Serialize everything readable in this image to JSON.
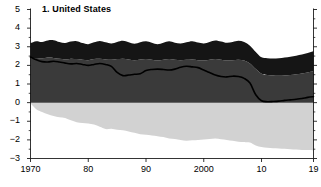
{
  "panel": {
    "title": "1. United States"
  },
  "chart_data": {
    "type": "area",
    "title": "1. United States",
    "subtitle": "",
    "xlabel": "",
    "ylabel": "",
    "xlim": [
      1970,
      2019
    ],
    "ylim": [
      -3,
      5
    ],
    "grid": false,
    "legend_position": "none",
    "stacked": true,
    "zero_line": 0,
    "y_ticks": [
      -3,
      -2,
      -1,
      0,
      1,
      2,
      3,
      4,
      5
    ],
    "y_tick_labels": [
      "−3",
      "−2",
      "−1",
      "0",
      "1",
      "2",
      "3",
      "4",
      "5"
    ],
    "y_minor_ticks": [
      -2.5,
      -1.5,
      -0.5,
      0.5,
      1.5,
      2.5,
      3.5,
      4.5
    ],
    "x_ticks": [
      1970,
      1980,
      1990,
      2000,
      2010,
      2019
    ],
    "x_tick_labels": [
      "1970",
      "80",
      "90",
      "2000",
      "10",
      "19"
    ],
    "x": [
      1970,
      1971,
      1972,
      1973,
      1974,
      1975,
      1976,
      1977,
      1978,
      1979,
      1980,
      1981,
      1982,
      1983,
      1984,
      1985,
      1986,
      1987,
      1988,
      1989,
      1990,
      1991,
      1992,
      1993,
      1994,
      1995,
      1996,
      1997,
      1998,
      1999,
      2000,
      2001,
      2002,
      2003,
      2004,
      2005,
      2006,
      2007,
      2008,
      2009,
      2010,
      2011,
      2012,
      2013,
      2014,
      2015,
      2016,
      2017,
      2018,
      2019
    ],
    "series": [
      {
        "name": "upper-band",
        "color": "#151515",
        "stack_from": "positive-band",
        "values": [
          0.85,
          0.9,
          0.88,
          0.92,
          0.95,
          0.9,
          0.88,
          0.92,
          0.96,
          0.9,
          0.86,
          0.9,
          0.95,
          0.92,
          0.88,
          0.92,
          0.96,
          0.92,
          0.88,
          0.92,
          0.95,
          0.92,
          0.88,
          0.92,
          0.96,
          0.92,
          0.9,
          0.94,
          0.98,
          0.95,
          0.92,
          0.96,
          1.0,
          0.98,
          0.95,
          0.98,
          1.02,
          1.0,
          0.96,
          0.92,
          0.88,
          0.9,
          0.92,
          0.94,
          0.96,
          0.98,
          1.0,
          1.02,
          1.05,
          1.08
        ]
      },
      {
        "name": "positive-band",
        "color": "#3a3a3a",
        "stack_from": "zero",
        "values": [
          2.35,
          2.4,
          2.38,
          2.42,
          2.4,
          2.35,
          2.32,
          2.36,
          2.34,
          2.3,
          2.28,
          2.34,
          2.36,
          2.32,
          2.3,
          2.34,
          2.36,
          2.32,
          2.28,
          2.32,
          2.34,
          2.3,
          2.26,
          2.3,
          2.34,
          2.3,
          2.28,
          2.3,
          2.32,
          2.28,
          2.26,
          2.3,
          2.34,
          2.3,
          2.26,
          2.28,
          2.3,
          2.26,
          2.1,
          1.8,
          1.55,
          1.48,
          1.45,
          1.44,
          1.46,
          1.48,
          1.52,
          1.56,
          1.62,
          1.68
        ]
      },
      {
        "name": "negative-band",
        "color": "#d2d2d2",
        "stack_from": "zero",
        "values": [
          -0.05,
          -0.35,
          -0.5,
          -0.62,
          -0.72,
          -0.78,
          -0.82,
          -0.95,
          -1.05,
          -1.1,
          -1.12,
          -1.18,
          -1.3,
          -1.42,
          -1.4,
          -1.45,
          -1.48,
          -1.55,
          -1.62,
          -1.7,
          -1.72,
          -1.76,
          -1.8,
          -1.85,
          -1.92,
          -1.95,
          -2.0,
          -2.05,
          -2.02,
          -2.0,
          -1.98,
          -1.95,
          -1.92,
          -1.96,
          -2.0,
          -2.05,
          -2.1,
          -2.12,
          -2.14,
          -2.3,
          -2.38,
          -2.42,
          -2.45,
          -2.46,
          -2.48,
          -2.5,
          -2.52,
          -2.54,
          -2.55,
          -2.56
        ]
      }
    ],
    "lines": [
      {
        "name": "net-line",
        "color": "#000000",
        "width": 1.6,
        "values": [
          2.45,
          2.3,
          2.2,
          2.18,
          2.22,
          2.18,
          2.12,
          2.08,
          2.1,
          2.05,
          2.0,
          2.05,
          2.1,
          2.05,
          1.95,
          1.62,
          1.45,
          1.48,
          1.52,
          1.55,
          1.72,
          1.78,
          1.8,
          1.78,
          1.75,
          1.8,
          1.9,
          1.95,
          1.92,
          1.88,
          1.75,
          1.62,
          1.48,
          1.4,
          1.38,
          1.42,
          1.4,
          1.3,
          1.05,
          0.42,
          0.1,
          0.05,
          0.06,
          0.08,
          0.12,
          0.15,
          0.18,
          0.22,
          0.28,
          0.32
        ]
      }
    ]
  }
}
